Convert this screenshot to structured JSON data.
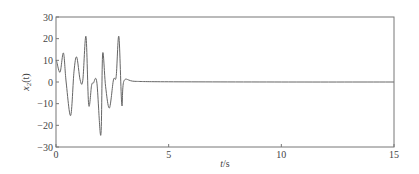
{
  "chart_data": {
    "type": "line",
    "title": "",
    "xlabel": "t/s",
    "ylabel": "x2(t)",
    "ylabel_parts": {
      "base": "x",
      "sub": "2",
      "suffix": "(t)"
    },
    "xlabel_parts": {
      "var": "t",
      "unit": "/s"
    },
    "xlim": [
      0,
      15
    ],
    "ylim": [
      -30,
      30
    ],
    "xticks": [
      0,
      5,
      10,
      15
    ],
    "xtick_labels": [
      "0",
      "5",
      "10",
      "15"
    ],
    "yticks": [
      30,
      20,
      10,
      0,
      -10,
      -20,
      -30
    ],
    "ytick_labels": [
      "30",
      "20",
      "10",
      "0",
      "−10",
      "−20",
      "−30"
    ],
    "grid": false,
    "legend": null,
    "series": [
      {
        "name": "x2(t)",
        "color": "#666666",
        "x": [
          0.0,
          0.03,
          0.18,
          0.33,
          0.45,
          0.65,
          0.8,
          0.92,
          1.07,
          1.19,
          1.33,
          1.45,
          1.58,
          1.66,
          1.81,
          1.99,
          2.07,
          2.2,
          2.37,
          2.55,
          2.67,
          2.79,
          2.92,
          3.02,
          3.5,
          5.0,
          10.0,
          15.0
        ],
        "y": [
          10.0,
          9.5,
          4.5,
          13.4,
          0.0,
          -15.5,
          5.0,
          11.5,
          1.0,
          0.8,
          21.0,
          -10.5,
          -1.5,
          -0.5,
          0.0,
          -24.5,
          13.0,
          -2.0,
          -12.0,
          1.0,
          2.5,
          21.0,
          -10.5,
          0.6,
          0.3,
          0.1,
          0.0,
          0.0
        ]
      }
    ]
  }
}
